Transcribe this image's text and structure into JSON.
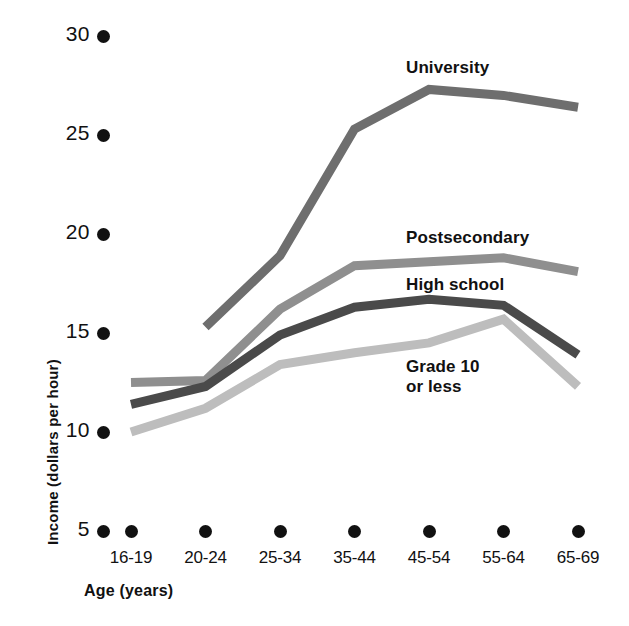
{
  "chart_data": {
    "type": "line",
    "title": "",
    "xlabel": "Age (years)",
    "ylabel": "Income (dollars per hour)",
    "categories": [
      "16-19",
      "20-24",
      "25-34",
      "35-44",
      "45-54",
      "55-64",
      "65-69"
    ],
    "yticks": [
      "5",
      "10",
      "15",
      "20",
      "25",
      "30"
    ],
    "ylim": [
      5,
      30
    ],
    "grid": false,
    "legend_position": "inline-right",
    "series": [
      {
        "name": "University",
        "color": "#6e6e6e",
        "values": [
          null,
          15.3,
          18.9,
          25.3,
          27.3,
          27.0,
          26.4
        ]
      },
      {
        "name": "Postsecondary",
        "color": "#8f8f8f",
        "values": [
          12.5,
          12.6,
          16.2,
          18.4,
          18.6,
          18.8,
          18.1
        ]
      },
      {
        "name": "High school",
        "color": "#4a4a4a",
        "values": [
          11.4,
          12.3,
          14.9,
          16.3,
          16.7,
          16.4,
          13.9
        ]
      },
      {
        "name": "Grade 10\nor less",
        "color": "#bdbdbd",
        "values": [
          10.0,
          11.2,
          13.4,
          14.0,
          14.5,
          15.7,
          12.3
        ]
      }
    ],
    "annotations": [
      {
        "id": "university",
        "text": "University",
        "x": 406,
        "y": 58
      },
      {
        "id": "postsecondary",
        "text": "Postsecondary",
        "x": 406,
        "y": 228
      },
      {
        "id": "high-school",
        "text": "High school",
        "x": 406,
        "y": 275
      },
      {
        "id": "grade-10",
        "text": "Grade 10\nor less",
        "x": 406,
        "y": 357
      }
    ]
  },
  "axes": {
    "y_title": "Income (dollars per hour)",
    "x_title": "Age (years)"
  }
}
